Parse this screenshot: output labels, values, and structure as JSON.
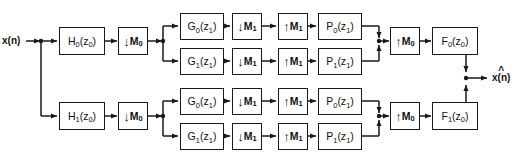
{
  "diagram": {
    "input_label": "x(n)",
    "output_label": "x(n)",
    "output_hat": "^",
    "line_color": "#1a1a1a",
    "background": "#ffffff"
  },
  "analysis_stage0": [
    {
      "id": "H0",
      "label_main": "H",
      "label_sub": "0",
      "label_arg": "(z",
      "label_arg_sub": "0",
      "label_close": ")",
      "x": 59,
      "y": 27,
      "w": 46,
      "h": 28
    },
    {
      "id": "H1",
      "label_main": "H",
      "label_sub": "1",
      "label_arg": "(z",
      "label_arg_sub": "0",
      "label_close": ")",
      "x": 59,
      "y": 102,
      "w": 46,
      "h": 28
    }
  ],
  "decimators_stage0": [
    {
      "id": "D0_top",
      "arrow": "↓",
      "letter": "M",
      "sub": "0",
      "x": 118,
      "y": 27,
      "w": 30,
      "h": 28
    },
    {
      "id": "D0_bot",
      "arrow": "↓",
      "letter": "M",
      "sub": "0",
      "x": 118,
      "y": 102,
      "w": 30,
      "h": 28
    }
  ],
  "branches": [
    {
      "id": "branch-0",
      "g": {
        "label_main": "G",
        "label_sub": "0",
        "label_arg": "(z",
        "label_arg_sub": "1",
        "label_close": ")",
        "x": 180,
        "y": 13,
        "w": 44,
        "h": 27
      },
      "dec": {
        "arrow": "↓",
        "letter": "M",
        "sub": "1",
        "x": 232,
        "y": 13,
        "w": 30,
        "h": 27
      },
      "exp": {
        "arrow": "↑",
        "letter": "M",
        "sub": "1",
        "x": 278,
        "y": 13,
        "w": 30,
        "h": 27
      },
      "p": {
        "label_main": "P",
        "label_sub": "0",
        "label_arg": "(z",
        "label_arg_sub": "1",
        "label_close": ")",
        "x": 318,
        "y": 13,
        "w": 44,
        "h": 27
      }
    },
    {
      "id": "branch-1",
      "g": {
        "label_main": "G",
        "label_sub": "1",
        "label_arg": "(z",
        "label_arg_sub": "1",
        "label_close": ")",
        "x": 180,
        "y": 48,
        "w": 44,
        "h": 27
      },
      "dec": {
        "arrow": "↓",
        "letter": "M",
        "sub": "1",
        "x": 232,
        "y": 48,
        "w": 30,
        "h": 27
      },
      "exp": {
        "arrow": "↑",
        "letter": "M",
        "sub": "1",
        "x": 278,
        "y": 48,
        "w": 30,
        "h": 27
      },
      "p": {
        "label_main": "P",
        "label_sub": "1",
        "label_arg": "(z",
        "label_arg_sub": "1",
        "label_close": ")",
        "x": 318,
        "y": 48,
        "w": 44,
        "h": 27
      }
    },
    {
      "id": "branch-2",
      "g": {
        "label_main": "G",
        "label_sub": "0",
        "label_arg": "(z",
        "label_arg_sub": "1",
        "label_close": ")",
        "x": 180,
        "y": 88,
        "w": 44,
        "h": 27
      },
      "dec": {
        "arrow": "↓",
        "letter": "M",
        "sub": "1",
        "x": 232,
        "y": 88,
        "w": 30,
        "h": 27
      },
      "exp": {
        "arrow": "↑",
        "letter": "M",
        "sub": "1",
        "x": 278,
        "y": 88,
        "w": 30,
        "h": 27
      },
      "p": {
        "label_main": "P",
        "label_sub": "0",
        "label_arg": "(z",
        "label_arg_sub": "1",
        "label_close": ")",
        "x": 318,
        "y": 88,
        "w": 44,
        "h": 27
      }
    },
    {
      "id": "branch-3",
      "g": {
        "label_main": "G",
        "label_sub": "1",
        "label_arg": "(z",
        "label_arg_sub": "1",
        "label_close": ")",
        "x": 180,
        "y": 123,
        "w": 44,
        "h": 27
      },
      "dec": {
        "arrow": "↓",
        "letter": "M",
        "sub": "1",
        "x": 232,
        "y": 123,
        "w": 30,
        "h": 27
      },
      "exp": {
        "arrow": "↑",
        "letter": "M",
        "sub": "1",
        "x": 278,
        "y": 123,
        "w": 30,
        "h": 27
      },
      "p": {
        "label_main": "P",
        "label_sub": "1",
        "label_arg": "(z",
        "label_arg_sub": "1",
        "label_close": ")",
        "x": 318,
        "y": 123,
        "w": 44,
        "h": 27
      }
    }
  ],
  "expanders_stage0": [
    {
      "id": "U0_top",
      "arrow": "↑",
      "letter": "M",
      "sub": "0",
      "x": 390,
      "y": 27,
      "w": 30,
      "h": 28
    },
    {
      "id": "U0_bot",
      "arrow": "↑",
      "letter": "M",
      "sub": "0",
      "x": 390,
      "y": 102,
      "w": 30,
      "h": 28
    }
  ],
  "synthesis_stage0": [
    {
      "id": "F0",
      "label_main": "F",
      "label_sub": "0",
      "label_arg": "(z",
      "label_arg_sub": "0",
      "label_close": ")",
      "x": 432,
      "y": 27,
      "w": 46,
      "h": 28
    },
    {
      "id": "F1",
      "label_main": "F",
      "label_sub": "1",
      "label_arg": "(z",
      "label_arg_sub": "0",
      "label_close": ")",
      "x": 432,
      "y": 102,
      "w": 46,
      "h": 28
    }
  ]
}
